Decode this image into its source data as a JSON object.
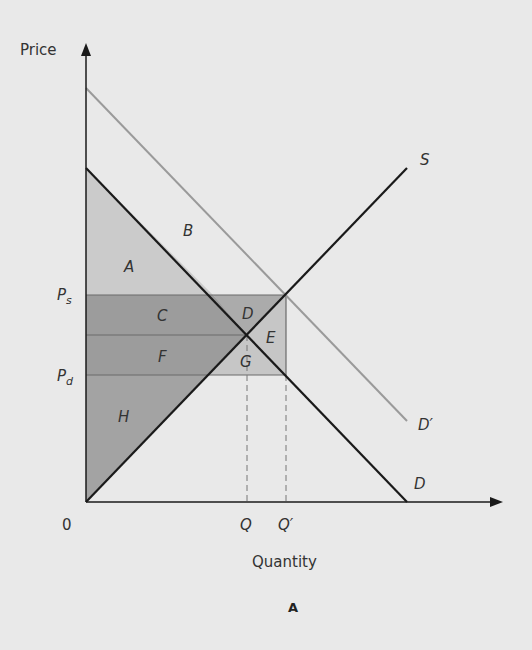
{
  "figure": {
    "caption": "A",
    "y_axis_label": "Price",
    "x_axis_label": "Quantity",
    "origin_label": "0",
    "price_labels": {
      "ps": "P",
      "ps_sub": "s",
      "pd": "P",
      "pd_sub": "d"
    },
    "quantity_labels": {
      "q": "Q",
      "q_prime": "Q′"
    },
    "curve_labels": {
      "supply": "S",
      "demand": "D",
      "demand_shifted": "D′"
    },
    "region_labels": {
      "a": "A",
      "b": "B",
      "c": "C",
      "d": "D",
      "e": "E",
      "f": "F",
      "g": "G",
      "h": "H"
    },
    "colors": {
      "background": "#e9e9e9",
      "region_a": "#cbcbcb",
      "region_cf": "#9c9c9c",
      "region_d": "#ababab",
      "region_eg": "#c6c6c6",
      "region_h": "#a3a3a3",
      "demand_shifted_line": "#9a9a9a",
      "line": "#1a1a1a"
    }
  }
}
